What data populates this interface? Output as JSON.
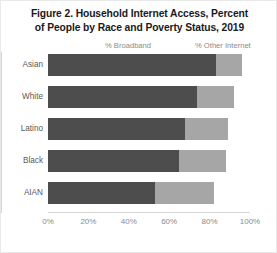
{
  "chart_data": {
    "type": "bar",
    "orientation": "horizontal",
    "stacked": true,
    "title": "Figure 2. Household Internet Access, Percent of People by Race and Poverty Status, 2019",
    "title_lines": [
      "Figure 2. Household Internet Access, Percent",
      "of People by Race and Poverty Status, 2019"
    ],
    "categories": [
      "Asian",
      "White",
      "Latino",
      "Black",
      "AIAN"
    ],
    "series": [
      {
        "name": "% Broadband",
        "color": "#4d4d4d",
        "values": [
          83,
          74,
          68,
          65,
          53
        ]
      },
      {
        "name": "% Other Internet",
        "color": "#a6a6a6",
        "values": [
          13,
          18,
          21,
          23,
          29
        ]
      }
    ],
    "legend": [
      "% Broadband",
      "% Other Internet"
    ],
    "legend_position": "top",
    "xlabel": "",
    "ylabel": "",
    "xlim": [
      0,
      100
    ],
    "xticks": [
      "0%",
      "20%",
      "40%",
      "60%",
      "80%",
      "100%"
    ],
    "xtick_values": [
      0,
      20,
      40,
      60,
      80,
      100
    ],
    "grid": false
  }
}
